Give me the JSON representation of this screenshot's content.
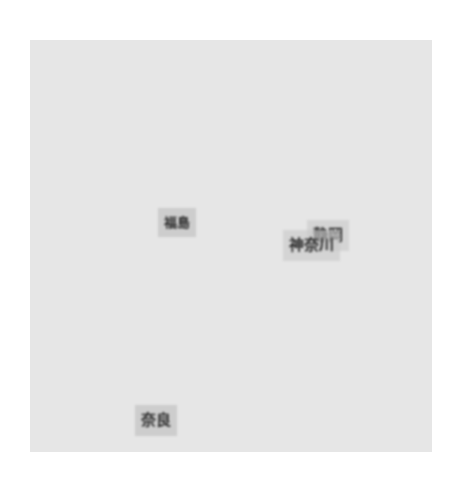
{
  "map": {
    "background_color": "#e6e6e6",
    "labels": [
      {
        "id": "fukushima",
        "text": "福島",
        "x": 158,
        "y": 208
      },
      {
        "id": "shizuoka",
        "text": "静岡",
        "x": 307,
        "y": 220
      },
      {
        "id": "kanagawa",
        "text": "神奈川",
        "x": 283,
        "y": 230
      },
      {
        "id": "nara",
        "text": "奈良",
        "x": 135,
        "y": 405
      }
    ]
  }
}
